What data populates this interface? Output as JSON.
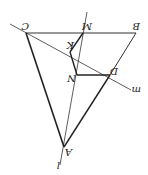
{
  "diagram": {
    "points": {
      "C": {
        "label": "C",
        "x": 26,
        "y": 33
      },
      "M": {
        "label": "M",
        "x": 83,
        "y": 33
      },
      "B": {
        "label": "B",
        "x": 136,
        "y": 33
      },
      "K": {
        "label": "K",
        "x": 70,
        "y": 52
      },
      "N": {
        "label": "N",
        "x": 77,
        "y": 75
      },
      "D": {
        "label": "D",
        "x": 110,
        "y": 75
      },
      "A": {
        "label": "A",
        "x": 64,
        "y": 147
      }
    },
    "lines": {
      "l": {
        "label": "l"
      },
      "m": {
        "label": "m"
      }
    },
    "colors": {
      "stroke": "#222222",
      "background": "#ffffff"
    }
  }
}
